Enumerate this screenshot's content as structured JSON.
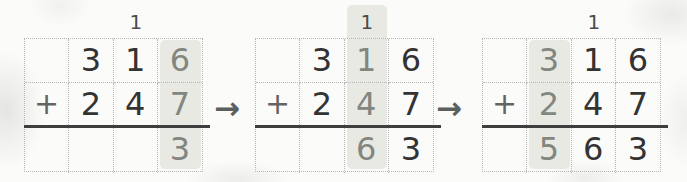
{
  "colors": {
    "background": "#fbfbfa",
    "column_highlight": "#e8e9e3",
    "digit": "#333333",
    "highlighted_digit": "#82867f",
    "carry_mark": "#4c4c4c",
    "plus_sign": "#646464",
    "grid_dotted_border": "#b6b6b6",
    "sum_rule_line": "#3e3e3e",
    "arrow": "#5b5f5e"
  },
  "steps": [
    {
      "carry_above_tens": "1",
      "highlighted_place": "ones",
      "rows": [
        [
          "",
          "3",
          "1",
          "6"
        ],
        [
          "+",
          "2",
          "4",
          "7"
        ],
        [
          "",
          "",
          "",
          "3"
        ]
      ]
    },
    {
      "carry_above_tens": "1",
      "highlighted_place": "tens",
      "rows": [
        [
          "",
          "3",
          "1",
          "6"
        ],
        [
          "+",
          "2",
          "4",
          "7"
        ],
        [
          "",
          "",
          "6",
          "3"
        ]
      ]
    },
    {
      "carry_above_tens": "1",
      "highlighted_place": "hundreds",
      "rows": [
        [
          "",
          "3",
          "1",
          "6"
        ],
        [
          "+",
          "2",
          "4",
          "7"
        ],
        [
          "",
          "5",
          "6",
          "3"
        ]
      ]
    }
  ],
  "arrows": [
    "→",
    "→"
  ]
}
